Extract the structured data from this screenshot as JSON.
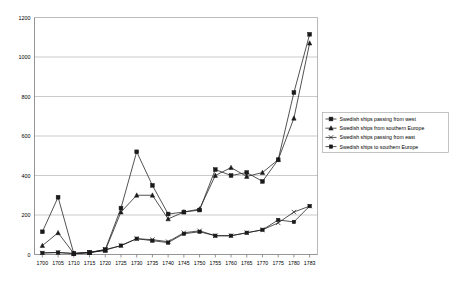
{
  "chart_data": {
    "type": "line",
    "title": "",
    "subtitle": "",
    "xlabel": "",
    "ylabel": "",
    "ylim": [
      0,
      1200
    ],
    "ytick_values": [
      0,
      200,
      400,
      600,
      800,
      1000,
      1200
    ],
    "ytick_labels": [
      "0",
      "200",
      "400",
      "600",
      "800",
      "1000",
      "1200"
    ],
    "grid": true,
    "legend_position": "right",
    "categories": [
      "1700",
      "1705",
      "1710",
      "1715",
      "1720",
      "1725",
      "1730",
      "1735",
      "1740",
      "1745",
      "1750",
      "1755",
      "1760",
      "1765",
      "1770",
      "1775",
      "1780",
      "1783"
    ],
    "series": [
      {
        "name": "Swedish ships passing from west",
        "marker": "square",
        "values": [
          115,
          290,
          5,
          10,
          25,
          235,
          520,
          350,
          205,
          215,
          225,
          430,
          400,
          415,
          370,
          480,
          820,
          1115
        ]
      },
      {
        "name": "Swedish ships from southern Europe",
        "marker": "triangle",
        "values": [
          45,
          110,
          5,
          10,
          20,
          215,
          300,
          300,
          180,
          215,
          230,
          400,
          440,
          395,
          415,
          480,
          690,
          1070
        ]
      },
      {
        "name": "Swedish ships passing from east",
        "marker": "cross",
        "values": [
          8,
          10,
          5,
          10,
          25,
          45,
          80,
          75,
          65,
          110,
          120,
          95,
          95,
          110,
          125,
          160,
          215,
          245
        ]
      },
      {
        "name": "Swedish ships to southern Europe",
        "marker": "square-small",
        "values": [
          8,
          10,
          5,
          10,
          22,
          45,
          80,
          70,
          60,
          105,
          115,
          95,
          95,
          110,
          125,
          175,
          165,
          245
        ]
      }
    ]
  },
  "legend": {
    "entries": [
      {
        "label": "Swedish ships passing from west",
        "marker": "square"
      },
      {
        "label": "Swedish ships from southern Europe",
        "marker": "triangle"
      },
      {
        "label": "Swedish ships passing from east",
        "marker": "cross"
      },
      {
        "label": "Swedish ships to southern Europe",
        "marker": "square-small"
      }
    ]
  },
  "colors": {
    "series": "#1a1a1a",
    "gridline": "#b4b4b4",
    "axis": "#7a7a7a",
    "background": "#ffffff"
  }
}
